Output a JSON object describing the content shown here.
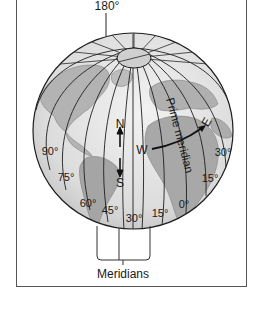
{
  "figure": {
    "top_label": "180°",
    "caption": "Meridians",
    "prime_meridian_label": "Prime meridian",
    "compass": {
      "north": "N",
      "south": "S",
      "west": "W",
      "east": "E"
    },
    "meridian_labels": {
      "w90": "90°",
      "w75": "75°",
      "w60": "60°",
      "w45": "45°",
      "w30": "30°",
      "w15": "15°",
      "zero": "0°",
      "e15": "15°",
      "e30": "30°"
    },
    "colors": {
      "background": "#ffffff",
      "ocean": "#e4e4e4",
      "land": "#a9a9a9",
      "lines": "#1e1e1e",
      "frame": "#555555"
    }
  }
}
